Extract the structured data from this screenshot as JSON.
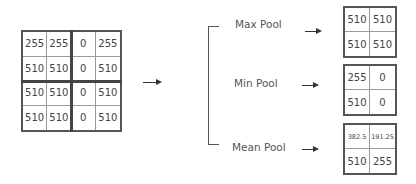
{
  "input_matrix": {
    "rows": [
      [
        "255",
        "255",
        "0",
        "255"
      ],
      [
        "510",
        "510",
        "0",
        "510"
      ],
      [
        "510",
        "510",
        "0",
        "510"
      ],
      [
        "510",
        "510",
        "0",
        "510"
      ]
    ]
  },
  "operations": [
    {
      "label": "Max Pool",
      "result": [
        [
          "510",
          "510"
        ],
        [
          "510",
          "510"
        ]
      ]
    },
    {
      "label": "Min Pool",
      "result": [
        [
          "255",
          "0"
        ],
        [
          "510",
          "0"
        ]
      ]
    },
    {
      "label": "Mean Pool",
      "result": [
        [
          "382.5",
          "191.25"
        ],
        [
          "510",
          "255"
        ]
      ]
    }
  ],
  "colors": {
    "grid_border": "#555555",
    "text": "#444444",
    "arrow": "#333333"
  }
}
